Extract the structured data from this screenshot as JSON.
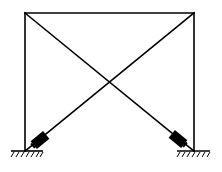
{
  "diagram": {
    "type": "structural frame with diagonal bracing and dampers",
    "frame": {
      "top_left": [
        25,
        13
      ],
      "top_right": [
        194,
        13
      ],
      "bottom_left": [
        25,
        151
      ],
      "bottom_right": [
        194,
        151
      ]
    },
    "braces": [
      {
        "name": "brace-left-to-right",
        "from": [
          25,
          13
        ],
        "to": [
          194,
          151
        ]
      },
      {
        "name": "brace-right-to-left",
        "from": [
          194,
          13
        ],
        "to": [
          25,
          151
        ]
      }
    ],
    "dampers": [
      {
        "name": "left-damper",
        "center": [
          40,
          140
        ],
        "angle_deg": -39
      },
      {
        "name": "right-damper",
        "center": [
          178,
          139
        ],
        "angle_deg": 39
      }
    ],
    "supports": [
      {
        "name": "left-fixed-support",
        "x1": 11,
        "x2": 43,
        "y": 151
      },
      {
        "name": "right-fixed-support",
        "x1": 177,
        "x2": 210,
        "y": 151
      }
    ],
    "colors": {
      "line": "#000000",
      "background": "#ffffff"
    }
  }
}
